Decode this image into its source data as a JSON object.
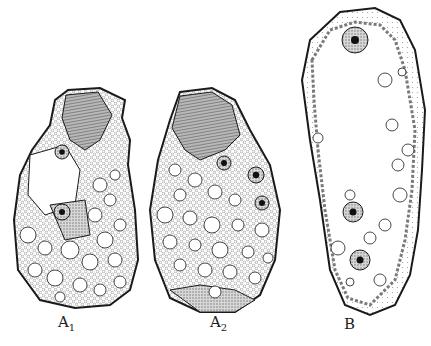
{
  "figure": {
    "panels": [
      {
        "id": "A1",
        "label_main": "A",
        "label_sub": "1"
      },
      {
        "id": "A2",
        "label_main": "A",
        "label_sub": "2"
      },
      {
        "id": "B",
        "label_main": "B",
        "label_sub": ""
      }
    ],
    "colors": {
      "ink": "#1a1a1a",
      "stipple": "#9a9a9a",
      "shade": "#7a7a7a",
      "paper": "#ffffff"
    }
  }
}
